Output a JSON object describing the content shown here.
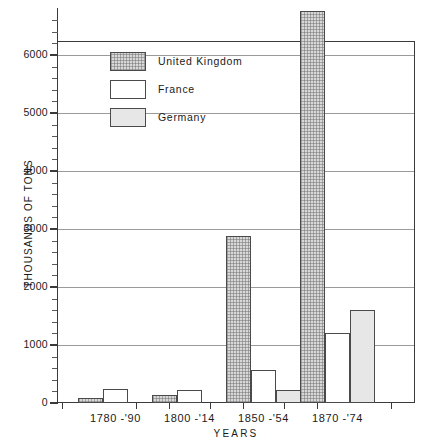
{
  "chart_data": {
    "type": "bar",
    "title": "",
    "xlabel": "YEARS",
    "ylabel": "THOUSANDS OF TONS",
    "categories": [
      "1780 -'90",
      "1800 -'14",
      "1850 -'54",
      "1870 -'74"
    ],
    "ylim": [
      0,
      6760
    ],
    "yticks": [
      0,
      1000,
      2000,
      3000,
      4000,
      5000,
      6000
    ],
    "ytick_labels": [
      "0",
      "1000",
      "2000",
      "3000",
      "4000",
      "5000",
      "6000"
    ],
    "minor_tick_interval": 200,
    "grid": "horizontal",
    "legend_position": "upper-left-inside",
    "series": [
      {
        "name": "United Kingdom",
        "color": "#d8d8d8",
        "pattern": "cross-hatch-dotted",
        "values": [
          80,
          140,
          2880,
          6760
        ]
      },
      {
        "name": "France",
        "color": "#ffffff",
        "pattern": "solid-white",
        "values": [
          240,
          220,
          570,
          1210
        ]
      },
      {
        "name": "Germany",
        "color": "#e7e7e7",
        "pattern": "light-shaded",
        "values": [
          0,
          0,
          225,
          1600
        ]
      }
    ]
  },
  "legend": {
    "items": [
      {
        "label": "United Kingdom",
        "swatch": "uk"
      },
      {
        "label": "France",
        "swatch": "france"
      },
      {
        "label": "Germany",
        "swatch": "germany"
      }
    ]
  }
}
